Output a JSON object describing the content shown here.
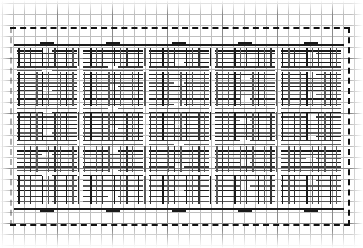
{
  "figure": {
    "type": "line-drawing",
    "canvas": {
      "width": 363,
      "height": 248,
      "background": "#ffffff"
    },
    "colors": {
      "background": "#ffffff",
      "grid_fine": "#bfbfbf",
      "grid_coarse": "#8a8a8a",
      "ink": "#1a1a1a",
      "ink_mid": "#333333",
      "ink_light": "#5a5a5a",
      "frame": "#111111"
    },
    "grid": {
      "fine_spacing_px": 11,
      "coarse_spacing_px": 55,
      "origin_x": 2,
      "origin_y": 3,
      "visible": true
    },
    "frame": {
      "style": "dashed",
      "stroke_width_px": 2,
      "left_x": 10,
      "right_x": 348,
      "top_y": 27,
      "bottom_y": 224
    },
    "pattern": {
      "module_width_px": 66,
      "module_repeat_count": 5,
      "symmetry": "horizontal-and-vertical-mirror",
      "field_left": 14,
      "field_right": 344,
      "field_top": 44,
      "field_bottom": 208
    }
  },
  "chart_data": {
    "type": "table",
    "xlabel": "",
    "ylabel": "",
    "grid": true,
    "legend_position": "none",
    "horizontal_rules_y": [
      50,
      53,
      58,
      62,
      66,
      70,
      74,
      78,
      82,
      86,
      90,
      94,
      98,
      104,
      108,
      112,
      116,
      120,
      124,
      128,
      132,
      136,
      140,
      144,
      150,
      154,
      158,
      162,
      166,
      170,
      175,
      180,
      185,
      190,
      196,
      201
    ],
    "vertical_rules_x": [
      18,
      24,
      30,
      36,
      42,
      48,
      54,
      60,
      66,
      72,
      78,
      84,
      90,
      96,
      102,
      108,
      114,
      120,
      126,
      132,
      138,
      144,
      150,
      156,
      162,
      168,
      174,
      180,
      186,
      192,
      198,
      204,
      210,
      216,
      222,
      228,
      234,
      240,
      246,
      252,
      258,
      264,
      270,
      276,
      282,
      288,
      294,
      300,
      306,
      312,
      318,
      324,
      330,
      336
    ],
    "module_centers_x": [
      47,
      113,
      179,
      245,
      311
    ],
    "band_rows_y": [
      50,
      62,
      86,
      112,
      140,
      166,
      190,
      201
    ]
  }
}
